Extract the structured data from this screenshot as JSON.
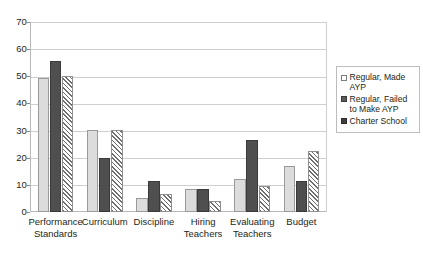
{
  "chart_data": {
    "type": "bar",
    "title": "",
    "subtitle": "",
    "xlabel": "",
    "ylabel": "",
    "ylim": [
      0,
      70
    ],
    "yticks": [
      0,
      10,
      20,
      30,
      40,
      50,
      60,
      70
    ],
    "grid": true,
    "legend_position": "right",
    "categories": [
      "Performance Standards",
      "Curriculum",
      "Discipline",
      "Hiring Teachers",
      "Evaluating Teachers",
      "Budget"
    ],
    "series": [
      {
        "name": "Regular, Made AYP",
        "style": "light-gray-solid",
        "values": [
          49.3,
          30.4,
          5.3,
          8.3,
          12.3,
          16.8
        ]
      },
      {
        "name": "Regular, Failed to Make AYP",
        "style": "dark-gray-solid",
        "values": [
          55.5,
          19.8,
          11.5,
          8.6,
          26.5,
          11.3
        ]
      },
      {
        "name": "Charter School",
        "style": "diagonal-hatch",
        "values": [
          50.0,
          30.4,
          6.5,
          4.2,
          9.5,
          22.3
        ]
      }
    ]
  },
  "legend": {
    "items": [
      {
        "label": "Regular, Made AYP"
      },
      {
        "label": "Regular, Failed to Make AYP"
      },
      {
        "label": "Charter School"
      }
    ]
  },
  "axis": {
    "y_tick_labels": [
      "70",
      "60",
      "50",
      "40",
      "30",
      "20",
      "10",
      "0"
    ]
  },
  "colors": {
    "series_1": "#dcdcdc",
    "series_2": "#4f4f4f",
    "series_3": "#6f6f6f",
    "gridline": "#cfcfcf",
    "axis": "#b9b9b9",
    "text": "#231f20",
    "background": "#ffffff"
  }
}
